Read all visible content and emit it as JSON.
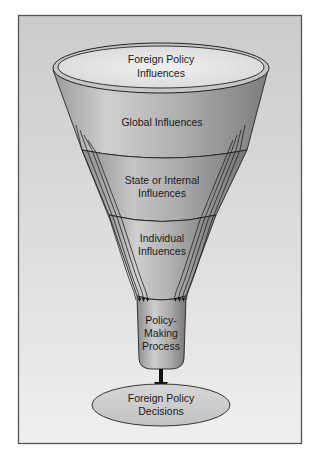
{
  "diagram": {
    "type": "funnel",
    "rim_label": [
      "Foreign Policy",
      "Influences"
    ],
    "layers": [
      {
        "id": "global",
        "label": [
          "Global Influences"
        ]
      },
      {
        "id": "state",
        "label": [
          "State or Internal",
          "Influences"
        ]
      },
      {
        "id": "individual",
        "label": [
          "Individual",
          "Influences"
        ]
      }
    ],
    "process_label": [
      "Policy-",
      "Making",
      "Process"
    ],
    "output_label": [
      "Foreign Policy",
      "Decisions"
    ],
    "colors": {
      "frame_border": "#555555",
      "background_top": "#cdcdcd",
      "background_bottom": "#efefef",
      "funnel_light": "#c9c9c9",
      "funnel_dark": "#8a8a8a",
      "rim_inner": "#e6e6e6",
      "arrow": "#111111"
    }
  }
}
